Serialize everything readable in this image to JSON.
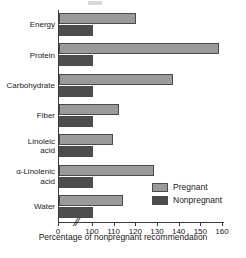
{
  "chart_data": {
    "type": "bar",
    "orientation": "horizontal",
    "title": "",
    "xlabel": "Percentage of nonpregnant recommendation",
    "ylabel": "",
    "categories": [
      "Energy",
      "Protein",
      "Carbohydrate",
      "Fiber",
      "Linoleic acid",
      "α-Linolenic acid",
      "Water"
    ],
    "series": [
      {
        "name": "Pregnant",
        "color": "#9a9a9a",
        "values": [
          120,
          158,
          137,
          112,
          109,
          128,
          114
        ]
      },
      {
        "name": "Nonpregnant",
        "color": "#4d4d4d",
        "values": [
          100,
          100,
          100,
          100,
          100,
          100,
          100
        ]
      }
    ],
    "xlim": [
      0,
      160
    ],
    "xticks": [
      0,
      100,
      110,
      120,
      130,
      140,
      150,
      160
    ],
    "xtick_labels": [
      "0",
      "100",
      "110",
      "120",
      "130",
      "140",
      "150",
      "160"
    ],
    "axis_break": {
      "present": true,
      "between": [
        0,
        100
      ],
      "symbol": "//"
    },
    "grid": false,
    "legend_position": "bottom-right"
  },
  "legend": {
    "entries": [
      {
        "label": "Pregnant",
        "swatch": "pregnant-swatch"
      },
      {
        "label": "Nonpregnant",
        "swatch": "nonpregnant-swatch"
      }
    ]
  }
}
